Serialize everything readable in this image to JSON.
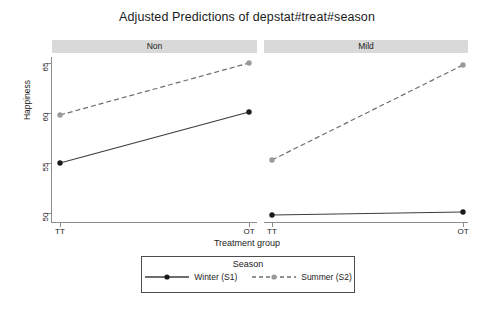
{
  "chart_data": {
    "type": "line",
    "title": "Adjusted Predictions of depstat#treat#season",
    "xlabel": "Treatment group",
    "ylabel": "Happiness",
    "categories": [
      "TT",
      "OT"
    ],
    "ylim": [
      47.5,
      66.5
    ],
    "yticks": [
      50,
      55,
      60,
      65
    ],
    "ytick_labels": [
      "50",
      "55",
      "60",
      "65"
    ],
    "grid": false,
    "legend_position": "bottom-center",
    "legend_title": "Season",
    "panels": [
      {
        "label": "Non",
        "series": [
          {
            "name": "Winter (S1)",
            "values": [
              55.0,
              60.1
            ]
          },
          {
            "name": "Summer (S2)",
            "values": [
              59.8,
              65.0
            ]
          }
        ]
      },
      {
        "label": "Mild",
        "series": [
          {
            "name": "Winter (S1)",
            "values": [
              49.8,
              50.1
            ]
          },
          {
            "name": "Summer (S2)",
            "values": [
              55.3,
              64.8
            ]
          }
        ]
      }
    ],
    "series_styles": [
      {
        "name": "Winter (S1)",
        "line": "solid",
        "color": "#3d3d3d",
        "marker_color": "#1a1a1a"
      },
      {
        "name": "Summer (S2)",
        "line": "dashed",
        "color": "#6e6e6e",
        "marker_color": "#9a9a9a"
      }
    ]
  },
  "colors": {
    "panel_header_bg": "#d9d9d9",
    "axis": "#8c8c8c",
    "winter": "#3d3d3d",
    "summer": "#9a9a9a",
    "legend_border": "#4d4d4d"
  }
}
